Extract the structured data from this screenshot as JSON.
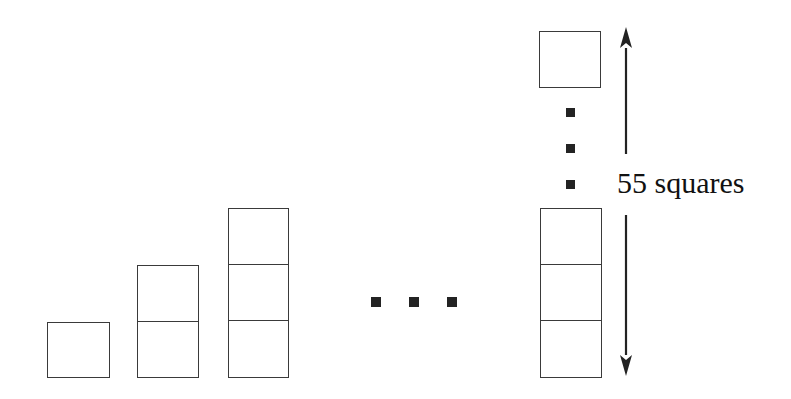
{
  "figure": {
    "background_color": "#ffffff",
    "stroke_color": "#3a3a3a",
    "dot_color": "#232323",
    "text_color": "#111111",
    "annotation": {
      "text": "55 squares",
      "font_size_px": 30,
      "x": 617,
      "y": 168
    },
    "stacks": [
      {
        "name": "stack-term-1",
        "square_count": 1,
        "x": 47,
        "y": 322,
        "width": 63,
        "cell_height": 56
      },
      {
        "name": "stack-term-2",
        "square_count": 2,
        "x": 137,
        "y": 265,
        "width": 62,
        "cell_height": 56.5
      },
      {
        "name": "stack-term-3",
        "square_count": 3,
        "x": 228,
        "y": 208,
        "width": 61,
        "cell_height": 56.5
      },
      {
        "name": "stack-term-n-bottom",
        "square_count": 3,
        "x": 540,
        "y": 208,
        "width": 62,
        "cell_height": 56.5
      },
      {
        "name": "stack-term-n-top",
        "square_count": 1,
        "x": 539,
        "y": 31,
        "width": 62,
        "cell_height": 57
      }
    ],
    "horizontal_ellipsis": {
      "name": "horizontal-ellipsis",
      "dot_size": 10,
      "dots": [
        {
          "x": 371,
          "y": 297
        },
        {
          "x": 409,
          "y": 297
        },
        {
          "x": 447,
          "y": 297
        }
      ]
    },
    "vertical_ellipsis": {
      "name": "vertical-ellipsis",
      "dot_size": 9,
      "dots": [
        {
          "x": 566,
          "y": 108
        },
        {
          "x": 566,
          "y": 144
        },
        {
          "x": 566,
          "y": 180
        }
      ]
    },
    "arrows": [
      {
        "name": "measure-arrow-up",
        "direction": "up",
        "x": 626,
        "tip_y": 27,
        "tail_y": 154
      },
      {
        "name": "measure-arrow-down",
        "direction": "down",
        "x": 626,
        "tip_y": 376,
        "tail_y": 215
      }
    ]
  },
  "chart_data": {
    "type": "bar",
    "categories": [
      "1",
      "2",
      "3",
      "...",
      "n"
    ],
    "values": [
      1,
      2,
      3,
      null,
      55
    ],
    "xlabel": "",
    "ylabel": "Number of squares",
    "annotations": [
      "55 squares"
    ]
  }
}
